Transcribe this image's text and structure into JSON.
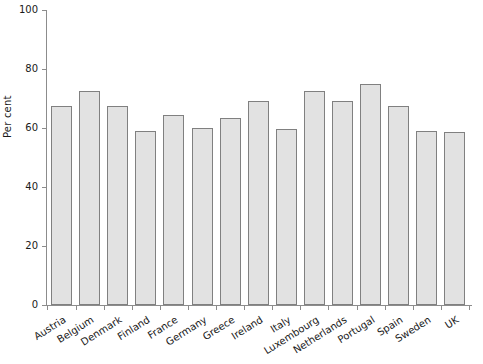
{
  "chart_data": {
    "type": "bar",
    "title": "",
    "xlabel": "",
    "ylabel": "Per cent",
    "ylim": [
      0,
      100
    ],
    "yticks": [
      0,
      20,
      40,
      60,
      80,
      100
    ],
    "grid": false,
    "legend": "none",
    "categories": [
      "Austria",
      "Belgium",
      "Denmark",
      "Finland",
      "France",
      "Germany",
      "Greece",
      "Ireland",
      "Italy",
      "Luxembourg",
      "Netherlands",
      "Portugal",
      "Spain",
      "Sweden",
      "UK"
    ],
    "values": [
      67.5,
      72.5,
      67.5,
      59,
      64.5,
      60,
      63.5,
      69,
      59.5,
      72.5,
      69,
      75,
      67.5,
      59,
      58.5
    ],
    "bar_fill_color": "#e2e2e2",
    "bar_border_color": "#808080",
    "axis_color": "#8c8c8c",
    "text_color": "#1a1a1a"
  }
}
